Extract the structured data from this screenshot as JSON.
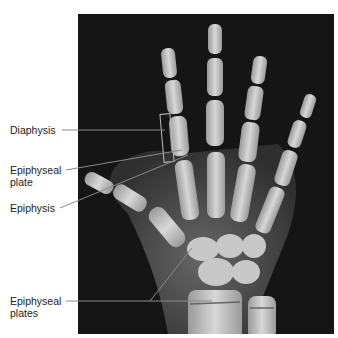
{
  "figure": {
    "labels": [
      {
        "id": "diaphysis",
        "text": "Diaphysis"
      },
      {
        "id": "epiphyseal-plate",
        "line1": "Epiphyseal",
        "line2": "plate"
      },
      {
        "id": "epiphysis",
        "text": "Epiphysis"
      },
      {
        "id": "epiphyseal-plates",
        "line1": "Epiphyseal",
        "line2": "plates"
      }
    ],
    "colors": {
      "background": "#ffffff",
      "xray_background": "#151515",
      "bone": "#d8d8d8",
      "leader_line": "#8a8a8a",
      "text": "#222222"
    }
  }
}
